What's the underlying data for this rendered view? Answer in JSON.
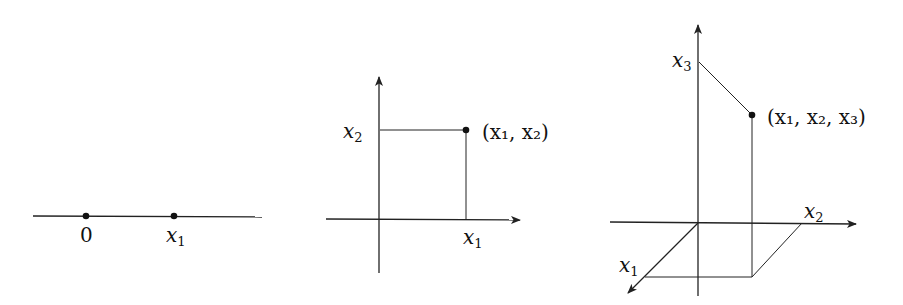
{
  "figure": {
    "panel_1d": {
      "origin_label": "0",
      "point_label": "x",
      "point_sub": "1"
    },
    "panel_2d": {
      "x_axis_label": "x",
      "x_axis_sub": "1",
      "y_axis_label": "x",
      "y_axis_sub": "2",
      "point_label": "(x₁, x₂)"
    },
    "panel_3d": {
      "x1_axis_label": "x",
      "x1_axis_sub": "1",
      "x2_axis_label": "x",
      "x2_axis_sub": "2",
      "x3_axis_label": "x",
      "x3_axis_sub": "3",
      "point_label": "(x₁, x₂, x₃)"
    },
    "colors": {
      "ink": "#222222",
      "background": "#ffffff"
    }
  }
}
